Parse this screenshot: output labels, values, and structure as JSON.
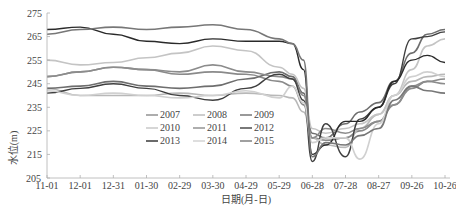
{
  "chart_data": {
    "type": "line",
    "title": "",
    "xlabel": "日期(月-日)",
    "ylabel": "水位(m)",
    "ylim": [
      205,
      275
    ],
    "yticks": [
      205,
      215,
      225,
      235,
      245,
      255,
      265,
      275
    ],
    "xticks": [
      "11-01",
      "12-01",
      "12-31",
      "01-30",
      "02-29",
      "03-30",
      "04-29",
      "05-29",
      "06-28",
      "07-28",
      "08-27",
      "09-26",
      "10-26"
    ],
    "grid": false,
    "legend_position": "inside lower center",
    "legend": [
      "2007",
      "2008",
      "2009",
      "2010",
      "2011",
      "2012",
      "2013",
      "2014",
      "2015"
    ],
    "x": [
      "11-01",
      "12-01",
      "12-31",
      "01-30",
      "02-29",
      "03-30",
      "04-29",
      "05-29",
      "06-10",
      "06-20",
      "06-28",
      "07-10",
      "07-28",
      "08-10",
      "08-27",
      "09-10",
      "09-26",
      "10-10",
      "10-26"
    ],
    "series": [
      {
        "name": "2007",
        "color": "#8a8a8a",
        "values": [
          248,
          250,
          252,
          251,
          249,
          250,
          249,
          246,
          244,
          236,
          222,
          221,
          222,
          225,
          229,
          236,
          243,
          246,
          247
        ]
      },
      {
        "name": "2008",
        "color": "#b8b8b8",
        "values": [
          243,
          240,
          240,
          240,
          241,
          240,
          241,
          240,
          239,
          233,
          222,
          219,
          218,
          226,
          232,
          240,
          246,
          248,
          249
        ]
      },
      {
        "name": "2009",
        "color": "#6e6e6e",
        "values": [
          243,
          244,
          246,
          244,
          243,
          244,
          247,
          250,
          248,
          241,
          224,
          222,
          228,
          233,
          237,
          246,
          258,
          266,
          268
        ]
      },
      {
        "name": "2010",
        "color": "#c4c4c4",
        "values": [
          255,
          253,
          254,
          256,
          258,
          261,
          259,
          252,
          249,
          243,
          226,
          224,
          226,
          228,
          232,
          240,
          251,
          261,
          264
        ]
      },
      {
        "name": "2011",
        "color": "#8c8c8c",
        "values": [
          248,
          250,
          252,
          251,
          250,
          253,
          250,
          248,
          247,
          240,
          222,
          226,
          224,
          226,
          229,
          236,
          244,
          246,
          245
        ]
      },
      {
        "name": "2012",
        "color": "#3f3f3f",
        "values": [
          241,
          243,
          245,
          243,
          240,
          238,
          243,
          249,
          247,
          238,
          212,
          228,
          214,
          230,
          235,
          245,
          264,
          265,
          267
        ]
      },
      {
        "name": "2013",
        "color": "#2a2a2a",
        "values": [
          268,
          269,
          266,
          263,
          262,
          264,
          263,
          263,
          262,
          251,
          215,
          219,
          229,
          229,
          235,
          246,
          255,
          257,
          254
        ]
      },
      {
        "name": "2014",
        "color": "#d0d0d0",
        "values": [
          242,
          240,
          241,
          240,
          239,
          240,
          242,
          239,
          244,
          237,
          220,
          222,
          222,
          213,
          228,
          240,
          248,
          250,
          248
        ]
      },
      {
        "name": "2015",
        "color": "#777777",
        "values": [
          266,
          268,
          269,
          268,
          269,
          270,
          268,
          264,
          262,
          255,
          214,
          220,
          219,
          223,
          226,
          238,
          244,
          242,
          241
        ]
      }
    ]
  },
  "axes": {
    "y_title": "水位(m)",
    "x_title": "日期(月-日)",
    "y_ticks": [
      "205",
      "215",
      "225",
      "235",
      "245",
      "255",
      "265",
      "275"
    ],
    "x_ticks": [
      "11-01",
      "12-01",
      "12-31",
      "01-30",
      "02-29",
      "03-30",
      "04-29",
      "05-29",
      "06-28",
      "07-28",
      "08-27",
      "09-26",
      "10-26"
    ]
  },
  "legend": {
    "items": [
      {
        "label": "2007",
        "color": "#8a8a8a"
      },
      {
        "label": "2008",
        "color": "#b8b8b8"
      },
      {
        "label": "2009",
        "color": "#6e6e6e"
      },
      {
        "label": "2010",
        "color": "#c4c4c4"
      },
      {
        "label": "2011",
        "color": "#8c8c8c"
      },
      {
        "label": "2012",
        "color": "#3f3f3f"
      },
      {
        "label": "2013",
        "color": "#2a2a2a"
      },
      {
        "label": "2014",
        "color": "#d0d0d0"
      },
      {
        "label": "2015",
        "color": "#777777"
      }
    ]
  }
}
